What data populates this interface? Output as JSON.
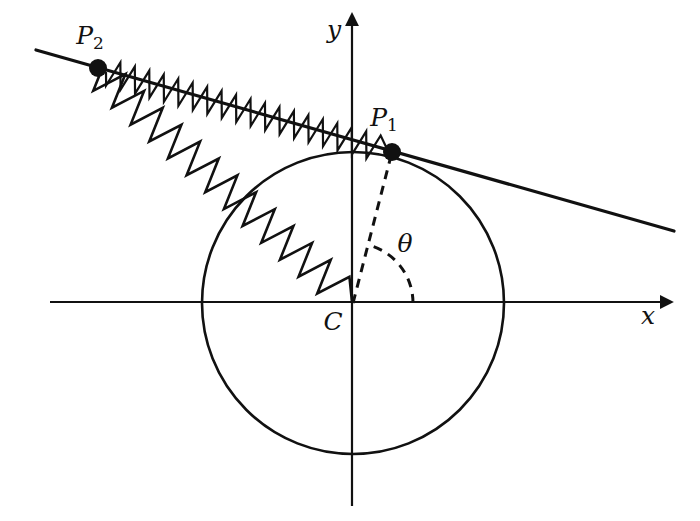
{
  "figure": {
    "type": "physics-mechanics-diagram",
    "background_color": "#ffffff",
    "stroke_color": "#111111"
  },
  "axes": {
    "x_axis": {
      "label": "x",
      "label_x": 648,
      "label_y": 324,
      "start_x": 50,
      "start_y": 302,
      "end_x": 662,
      "end_y": 302,
      "has_arrow": true
    },
    "y_axis": {
      "label": "y",
      "label_x": 334,
      "label_y": 38,
      "start_x": 352,
      "start_y": 506,
      "end_x": 352,
      "end_y": 24,
      "has_arrow": true
    }
  },
  "circle": {
    "name": "main-circle",
    "center_x": 353,
    "center_y": 303,
    "radius": 151,
    "stroke_width": 2.6
  },
  "points": [
    {
      "id": "P1",
      "label": "P",
      "subscript": "1",
      "x": 392,
      "y": 152,
      "dot_radius": 9,
      "label_x": 384,
      "label_y": 126
    },
    {
      "id": "P2",
      "label": "P",
      "subscript": "2",
      "x": 98,
      "y": 68,
      "dot_radius": 9,
      "label_x": 90,
      "label_y": 44
    },
    {
      "id": "C",
      "label": "C",
      "subscript": "",
      "x": 353,
      "y": 303,
      "dot_radius": 0,
      "label_x": 333,
      "label_y": 330
    }
  ],
  "angle": {
    "label": "θ",
    "label_x": 405,
    "label_y": 252,
    "arc_radius": 60,
    "vertex_x": 353,
    "vertex_y": 303,
    "start_deg": 0,
    "end_deg": 76,
    "value_deg": 76,
    "dashed": true
  },
  "radius_line": {
    "name": "radius-C-to-P1",
    "from_x": 353,
    "from_y": 303,
    "to_x": 392,
    "to_y": 152,
    "dashed": true
  },
  "tangent_line": {
    "name": "tangent-through-P1",
    "left_x": 36,
    "left_y": 50,
    "right_x": 674,
    "right_y": 231,
    "stroke_width": 3.2
  },
  "springs": [
    {
      "id": "spring-tangent",
      "name": "spring-P2-to-P1",
      "from_x": 106,
      "from_y": 72,
      "to_x": 388,
      "to_y": 151,
      "coils": 19,
      "amplitude": 13,
      "stroke_width": 2.2
    },
    {
      "id": "spring-radial",
      "name": "spring-P2-to-C",
      "from_x": 100,
      "from_y": 74,
      "to_x": 352,
      "to_y": 302,
      "coils": 13,
      "amplitude": 17,
      "stroke_width": 2.6
    }
  ],
  "chart_data": {
    "type": "diagram",
    "title": "",
    "elements": [
      "x-axis arrow with label x",
      "y-axis arrow with label y",
      "circle centred at origin C",
      "point P1 on the circle",
      "point P2 outside the circle on the tangent line",
      "dashed radius from C to P1",
      "dashed angle arc theta between the x-axis and the radius C-P1",
      "zigzag spring along tangent from P2 to P1",
      "zigzag spring from P2 to centre C"
    ]
  }
}
